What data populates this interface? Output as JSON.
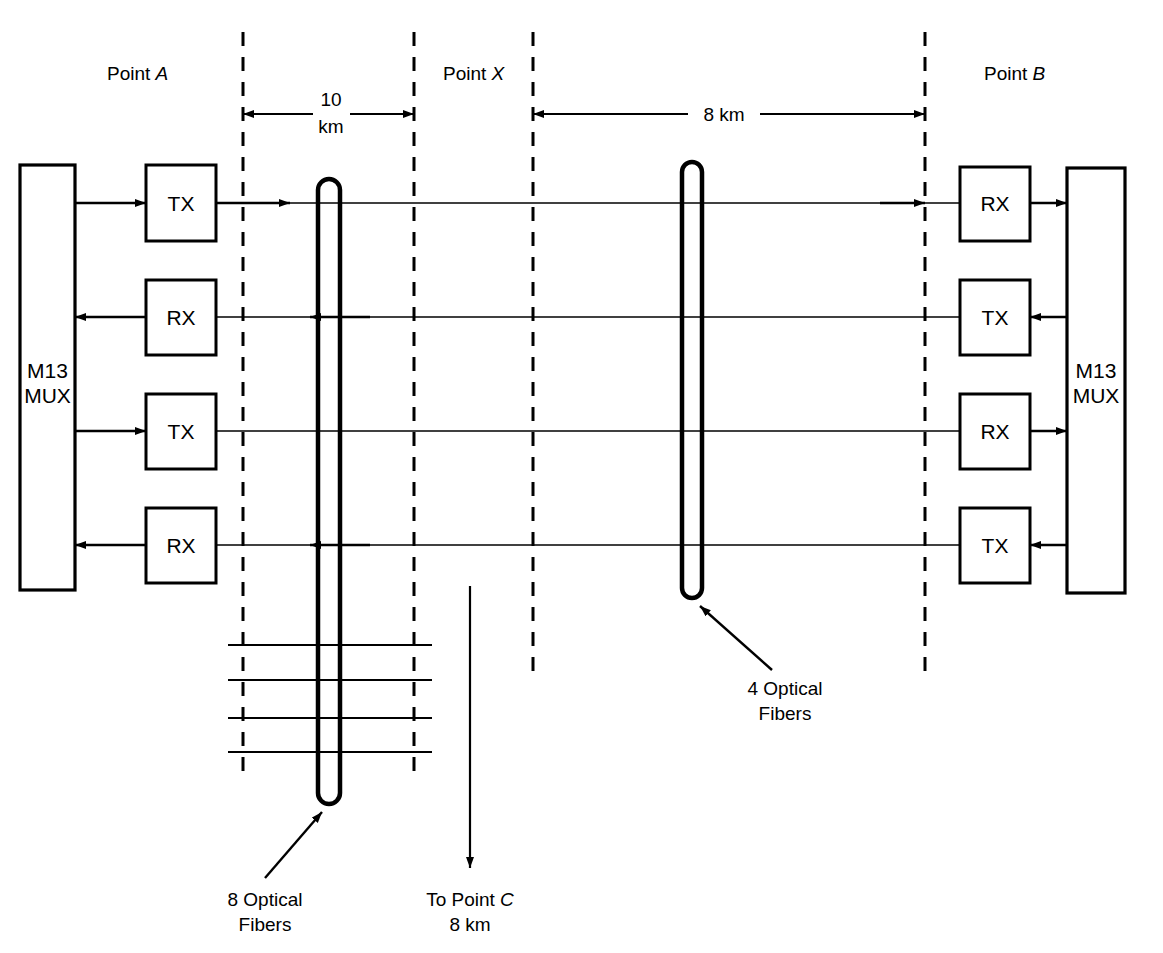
{
  "diagram": {
    "stroke_color": "#000000",
    "background_color": "#ffffff"
  },
  "zones": {
    "point_a": {
      "label_prefix": "Point ",
      "label_letter": "A"
    },
    "point_x": {
      "label_prefix": "Point ",
      "label_letter": "X"
    },
    "point_b": {
      "label_prefix": "Point ",
      "label_letter": "B"
    }
  },
  "dimensions": [
    {
      "name": "left-span",
      "value_line1": "10",
      "value_line2": "km"
    },
    {
      "name": "right-span",
      "value": "8 km"
    }
  ],
  "mux": {
    "left": {
      "line1": "M13",
      "line2": "MUX"
    },
    "right": {
      "line1": "M13",
      "line2": "MUX"
    }
  },
  "left_terminals": [
    {
      "label": "TX",
      "direction": "out"
    },
    {
      "label": "RX",
      "direction": "in"
    },
    {
      "label": "TX",
      "direction": "out"
    },
    {
      "label": "RX",
      "direction": "in"
    }
  ],
  "right_terminals": [
    {
      "label": "RX",
      "direction": "in"
    },
    {
      "label": "TX",
      "direction": "out"
    },
    {
      "label": "RX",
      "direction": "in"
    },
    {
      "label": "TX",
      "direction": "out"
    }
  ],
  "annotations": {
    "left_fiber": {
      "line1": "8 Optical",
      "line2": "Fibers"
    },
    "right_fiber": {
      "line1": "4 Optical",
      "line2": "Fibers"
    },
    "to_point_c": {
      "line1_prefix": "To Point ",
      "line1_letter": "C",
      "line2": "8 km"
    }
  }
}
